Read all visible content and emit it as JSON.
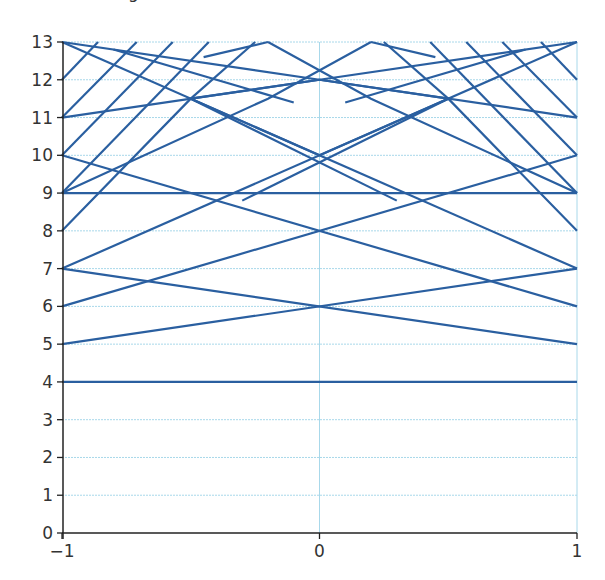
{
  "chart_data": {
    "type": "line",
    "title": "",
    "xlabel": "",
    "ylabel": "",
    "xlim": [
      -1,
      1
    ],
    "ylim": [
      0,
      13
    ],
    "x_ticks": [
      -1,
      0,
      1
    ],
    "x_tick_labels": [
      "−1",
      "0",
      "1"
    ],
    "y_ticks": [
      0,
      1,
      2,
      3,
      4,
      5,
      6,
      7,
      8,
      9,
      10,
      11,
      12,
      13
    ],
    "y_tick_labels": [
      "0",
      "1",
      "2",
      "3",
      "4",
      "5",
      "6",
      "7",
      "8",
      "9",
      "10",
      "11",
      "12",
      "13"
    ],
    "grid": {
      "horizontal": true,
      "vertical_at": [
        0,
        1
      ],
      "color": "#a8d8ea"
    },
    "line_color": "#2a5fa0",
    "axis_color": "#222222",
    "series": [
      {
        "name": "4-4",
        "points": [
          [
            -1,
            4
          ],
          [
            1,
            4
          ]
        ]
      },
      {
        "name": "5-7",
        "points": [
          [
            -1,
            5
          ],
          [
            1,
            7
          ]
        ]
      },
      {
        "name": "7-5",
        "points": [
          [
            -1,
            7
          ],
          [
            1,
            5
          ]
        ]
      },
      {
        "name": "6-10",
        "points": [
          [
            -1,
            6
          ],
          [
            1,
            10
          ]
        ]
      },
      {
        "name": "10-6",
        "points": [
          [
            -1,
            10
          ],
          [
            1,
            6
          ]
        ]
      },
      {
        "name": "9-9",
        "points": [
          [
            -1,
            9
          ],
          [
            1,
            9
          ]
        ]
      },
      {
        "name": "7-13",
        "points": [
          [
            -1,
            7
          ],
          [
            1,
            13
          ]
        ]
      },
      {
        "name": "13-7",
        "points": [
          [
            -1,
            13
          ],
          [
            1,
            7
          ]
        ]
      },
      {
        "name": "11-12-13",
        "points": [
          [
            -1,
            11
          ],
          [
            0,
            12
          ],
          [
            1,
            13
          ]
        ]
      },
      {
        "name": "13-12-11",
        "points": [
          [
            -1,
            13
          ],
          [
            0,
            12
          ],
          [
            1,
            11
          ]
        ]
      },
      {
        "name": "8-peak-left",
        "points": [
          [
            -1,
            8
          ],
          [
            -0.5,
            11.5
          ],
          [
            0,
            12
          ]
        ]
      },
      {
        "name": "8-peak-right",
        "points": [
          [
            0,
            12
          ],
          [
            0.5,
            11.5
          ],
          [
            1,
            8
          ]
        ]
      },
      {
        "name": "9-up-left",
        "points": [
          [
            -1,
            9
          ],
          [
            -0.43,
            13
          ]
        ]
      },
      {
        "name": "9-up-right",
        "points": [
          [
            0.43,
            13
          ],
          [
            1,
            9
          ]
        ]
      },
      {
        "name": "10-up-left",
        "points": [
          [
            -1,
            10
          ],
          [
            -0.57,
            13
          ]
        ]
      },
      {
        "name": "10-up-right",
        "points": [
          [
            0.57,
            13
          ],
          [
            1,
            10
          ]
        ]
      },
      {
        "name": "11-up-left",
        "points": [
          [
            -1,
            11
          ],
          [
            -0.71,
            13
          ]
        ]
      },
      {
        "name": "11-up-right",
        "points": [
          [
            0.71,
            13
          ],
          [
            1,
            11
          ]
        ]
      },
      {
        "name": "12-up-left",
        "points": [
          [
            -1,
            12
          ],
          [
            -0.86,
            13
          ]
        ]
      },
      {
        "name": "12-up-right",
        "points": [
          [
            0.86,
            13
          ],
          [
            1,
            12
          ]
        ]
      },
      {
        "name": "top-left-down",
        "points": [
          [
            -0.8,
            12.8
          ],
          [
            -0.1,
            11.4
          ]
        ]
      },
      {
        "name": "top-right-down",
        "points": [
          [
            0.1,
            11.4
          ],
          [
            0.8,
            12.8
          ]
        ]
      },
      {
        "name": "mid-left-a",
        "points": [
          [
            -0.25,
            13
          ],
          [
            -0.5,
            11.5
          ]
        ]
      },
      {
        "name": "mid-right-a",
        "points": [
          [
            0.25,
            13
          ],
          [
            0.5,
            11.5
          ]
        ]
      },
      {
        "name": "x-left-a",
        "points": [
          [
            -0.45,
            12.6
          ],
          [
            -0.2,
            13
          ]
        ]
      },
      {
        "name": "x-right-a",
        "points": [
          [
            0.45,
            12.6
          ],
          [
            0.2,
            13
          ]
        ]
      },
      {
        "name": "inner-left",
        "points": [
          [
            -0.5,
            11.5
          ],
          [
            0,
            10
          ]
        ]
      },
      {
        "name": "inner-right",
        "points": [
          [
            0.5,
            11.5
          ],
          [
            0,
            10
          ]
        ]
      },
      {
        "name": "lower-left-b",
        "points": [
          [
            -0.5,
            11.5
          ],
          [
            0.3,
            8.8
          ]
        ]
      },
      {
        "name": "lower-right-b",
        "points": [
          [
            0.5,
            11.5
          ],
          [
            -0.3,
            8.8
          ]
        ]
      },
      {
        "name": "steep-left-c",
        "points": [
          [
            -1,
            9
          ],
          [
            -0.2,
            11.5
          ],
          [
            0.2,
            13
          ]
        ]
      },
      {
        "name": "steep-right-c",
        "points": [
          [
            1,
            9
          ],
          [
            0.2,
            11.5
          ],
          [
            -0.2,
            13
          ]
        ]
      }
    ]
  },
  "axes": {
    "top_partial_label": "g"
  }
}
